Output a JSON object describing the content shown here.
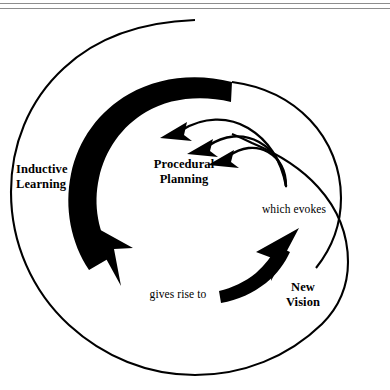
{
  "figure": {
    "type": "cyclical-process-spiral-diagram",
    "background_color": "#ffffff",
    "ink_color": "#000000",
    "rule_color": "#8d8d8d"
  },
  "rules": {
    "top_label": "horizontal-rule-upper",
    "bottom_label": "horizontal-rule-lower"
  },
  "labels": {
    "inductive_learning": "Inductive\nLearning",
    "procedural_planning": "Procedural\nPlanning",
    "which_evokes": "which evokes",
    "gives_rise_to": "gives rise to",
    "new_vision": "New\nVision"
  },
  "shapes": {
    "outer_spiral": "outer-thin-spiral-arc",
    "thick_arc": "thick-black-sweeping-arc-arrow",
    "thick_arc_head": "thick-arc-arrowhead",
    "inner_arrow_1": "inner-curved-arrow-outer",
    "inner_arrow_2": "inner-curved-arrow-middle",
    "inner_arrow_3": "inner-curved-arrow-inner",
    "new_vision_arrow": "tapered-upward-arrow"
  }
}
